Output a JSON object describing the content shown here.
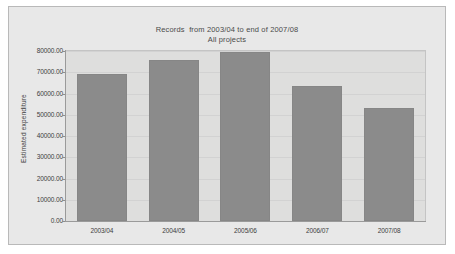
{
  "chart_data": {
    "type": "bar",
    "title": "Records  from 2003/04 to end of 2007/08",
    "subtitle": "All projects",
    "categories": [
      "2003/04",
      "2004/05",
      "2005/06",
      "2006/07",
      "2007/08"
    ],
    "values": [
      69000,
      76000,
      79500,
      63500,
      53000
    ],
    "xlabel": "",
    "ylabel": "Estimated expenditure",
    "ylim": [
      0,
      80000
    ],
    "ytick_labels": [
      "80000.00",
      "70000.00",
      "60000.00",
      "50000.00",
      "40000.00",
      "30000.00",
      "20000.00",
      "10000.00",
      "0.00"
    ],
    "ytick_values": [
      80000,
      70000,
      60000,
      50000,
      40000,
      30000,
      20000,
      10000,
      0
    ],
    "grid": true,
    "legend": "none",
    "bar_color": "#8b8b8b",
    "plot_background": "#dededd",
    "card_background": "#e8e8e8"
  }
}
